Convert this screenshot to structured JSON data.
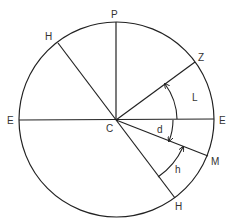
{
  "diagram": {
    "type": "celestial-sphere-meridian",
    "center": {
      "label": "C",
      "x": 116,
      "y": 120
    },
    "radius": 97,
    "line_color": "#222222",
    "label_color": "#333333",
    "points": {
      "P": {
        "label": "P",
        "angle_deg": 90
      },
      "Z": {
        "label": "Z",
        "angle_deg": 36
      },
      "E_left": {
        "label": "E",
        "angle_deg": 180
      },
      "E_right": {
        "label": "E",
        "angle_deg": 0
      },
      "M": {
        "label": "M",
        "angle_deg": -21
      },
      "H_upper": {
        "label": "H",
        "angle_deg": 127
      },
      "H_lower": {
        "label": "H",
        "angle_deg": -53
      }
    },
    "angles": {
      "L": {
        "label": "L",
        "from": "E_right",
        "to": "Z"
      },
      "d": {
        "label": "d",
        "from": "E_right",
        "to": "M"
      },
      "h": {
        "label": "h",
        "from": "H_lower",
        "to": "M"
      }
    }
  }
}
